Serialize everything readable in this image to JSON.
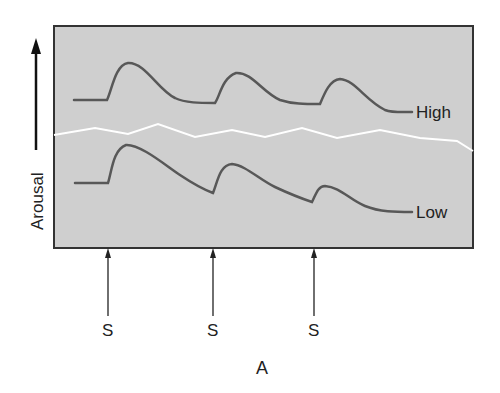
{
  "figure": {
    "panel_label": "A",
    "y_axis_label": "Arousal",
    "stimulus_label": "S",
    "stimuli": [
      {
        "label": "S",
        "x": 108
      },
      {
        "label": "S",
        "x": 213
      },
      {
        "label": "S",
        "x": 314
      }
    ],
    "curves": [
      {
        "name": "high-arousal-curve",
        "label": "High"
      },
      {
        "name": "low-arousal-curve",
        "label": "Low"
      }
    ],
    "colors": {
      "panel_fill": "#cfcfcf",
      "frame": "#333333",
      "curve": "#585858",
      "separator": "#ffffff",
      "text": "#222222"
    }
  }
}
